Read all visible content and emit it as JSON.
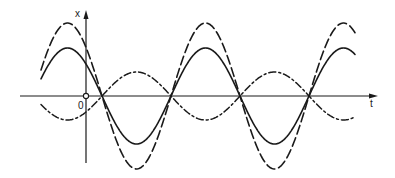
{
  "figure": {
    "labels": {
      "y_axis": "x",
      "origin": "0",
      "x_axis": "t"
    },
    "colors": {
      "ink": "#1a1a1a",
      "background": "#ffffff"
    }
  },
  "chart_data": {
    "type": "line",
    "title": "",
    "xlabel": "t",
    "ylabel": "x",
    "origin_label": "0",
    "grid": false,
    "legend": null,
    "geometry_px": {
      "origin": [
        86,
        96
      ],
      "x_axis": {
        "from": 20,
        "to": 378
      },
      "y_axis": {
        "from": 163,
        "to": 10
      },
      "curve_x_range": [
        41,
        355
      ],
      "period_px": 138,
      "phase_zero_crossing_px": 102
    },
    "series": [
      {
        "name": "solid",
        "style": "solid",
        "amplitude_px": 48,
        "phase": "x = -A·sin(2π(t - t0)/T)"
      },
      {
        "name": "long-dashed",
        "style": "dashed",
        "amplitude_px": 73,
        "phase": "x = -A·sin(2π(t - t0)/T)"
      },
      {
        "name": "dash-dot",
        "style": "dash-dot",
        "amplitude_px": 24,
        "phase": "x = +A·sin(2π(t - t0)/T)"
      }
    ],
    "annotations": [
      "open circle at origin"
    ]
  }
}
